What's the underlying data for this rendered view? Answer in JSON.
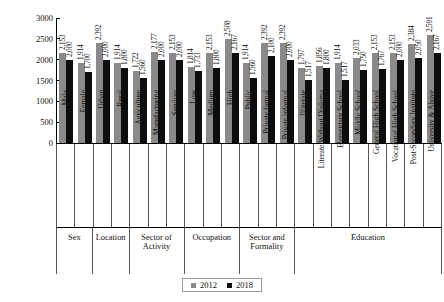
{
  "chart_data": {
    "type": "bar",
    "title": "",
    "xlabel": "",
    "ylabel": "Real Monthly Income in Egyptian Pounds",
    "ylim": [
      0,
      3000
    ],
    "yticks": [
      3000,
      2500,
      2000,
      1500,
      1000,
      500,
      0
    ],
    "grid": false,
    "legend_position": "bottom-center",
    "categories": [
      "Male",
      "Female",
      "Urban",
      "Rural",
      "Agriculture",
      "Manufacturing",
      "Services",
      "Low",
      "Medium",
      "High",
      "Public",
      "Private formal",
      "Private informal",
      "Illiterate",
      "Literate Without Diploma",
      "Elementary School",
      "Middle School",
      "General High School",
      "Vocational High School",
      "Post-Secondary Institute",
      "University & Above"
    ],
    "series": [
      {
        "name": "2012",
        "color": "#8a8a8a",
        "values": [
          2153,
          1914,
          2392,
          1914,
          1722,
          2177,
          2153,
          1814,
          2153,
          2508,
          1914,
          2392,
          2392,
          1797,
          1856,
          1914,
          2033,
          2153,
          2153,
          2384,
          2591
        ],
        "labels": [
          "2,153",
          "1,914",
          "2,392",
          "1,914",
          "1,722",
          "2,177",
          "2,153",
          "1,814",
          "2,153",
          "2,508",
          "1,914",
          "2,392",
          "2,392",
          "1,797",
          "1,856",
          "1,914",
          "2,033",
          "2,153",
          "2,153",
          "2,384",
          "2,591"
        ]
      },
      {
        "name": "2018",
        "color": "#0d0d0d",
        "values": [
          2000,
          1700,
          2000,
          1800,
          1560,
          2000,
          2000,
          1733,
          1800,
          2167,
          1560,
          2100,
          2000,
          1517,
          1800,
          1517,
          1750,
          1767,
          2000,
          2050,
          2167
        ],
        "labels": [
          "2,000",
          "1,700",
          "2,000",
          "1,800",
          "1,560",
          "2,000",
          "2,000",
          "1,733",
          "1,800",
          "2,167",
          "1,560",
          "2,100",
          "2,000",
          "1,517",
          "1,800",
          "1,517",
          "1,750",
          "1,767",
          "2,000",
          "2,050",
          "2,167"
        ]
      }
    ],
    "groups": [
      {
        "label": "Sex",
        "span": 2
      },
      {
        "label": "Location",
        "span": 2
      },
      {
        "label": "Sector of Activity",
        "span": 3
      },
      {
        "label": "Occupation",
        "span": 3
      },
      {
        "label": "Sector and Formality",
        "span": 3
      },
      {
        "label": "Education",
        "span": 8
      }
    ]
  }
}
